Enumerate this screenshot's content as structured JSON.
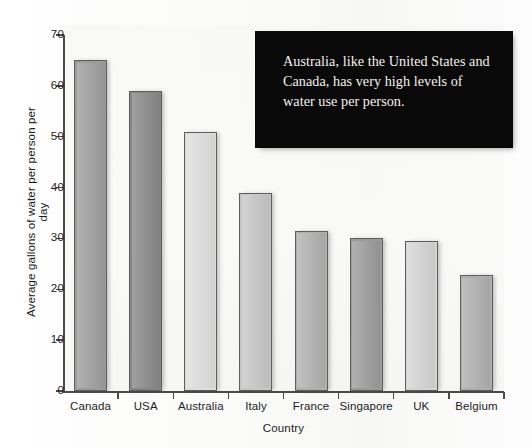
{
  "chart_data": {
    "type": "bar",
    "title": "",
    "xlabel": "Country",
    "ylabel": "Average gallons of water per person per day",
    "categories": [
      "Canada",
      "USA",
      "Australia",
      "Italy",
      "France",
      "Singapore",
      "UK",
      "Belgium"
    ],
    "values": [
      65,
      59,
      51,
      39,
      31.5,
      30,
      29.5,
      22.8
    ],
    "ylim": [
      0,
      70
    ],
    "yticks": [
      0,
      10,
      20,
      30,
      40,
      50,
      60,
      70
    ],
    "ytick_labels": [
      "0",
      "10",
      "20",
      "30",
      "40",
      "50",
      "60",
      "70"
    ],
    "grid": false,
    "legend": "none",
    "bar_colors": [
      "#9c9c9c",
      "#868686",
      "#dedede",
      "#c6c6c6",
      "#b0b0b0",
      "#9a9a9a",
      "#d4d4d4",
      "#aeaeae"
    ],
    "bar_border_color": "#5e5e5e",
    "axis_color": "#4a4a4a"
  },
  "annotation": {
    "text": "Australia, like the United States and Canada, has very high levels of water use per person.",
    "background": "#090909",
    "text_color": "#f4f1ec"
  }
}
